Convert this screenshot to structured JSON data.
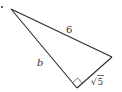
{
  "diagram": {
    "type": "right-triangle",
    "colors": {
      "stroke": "#2b2b2b",
      "label": "#333333",
      "background": "#ffffff"
    },
    "vertices": {
      "top_left": [
        11,
        9
      ],
      "right": [
        112,
        57
      ],
      "bottom_right_angle": [
        77,
        88
      ]
    },
    "bullet": "•",
    "labels": {
      "hypotenuse": "6",
      "left_leg": "b",
      "short_leg_radical": "√",
      "short_leg_radicand": "5"
    },
    "right_angle_marker": true
  }
}
